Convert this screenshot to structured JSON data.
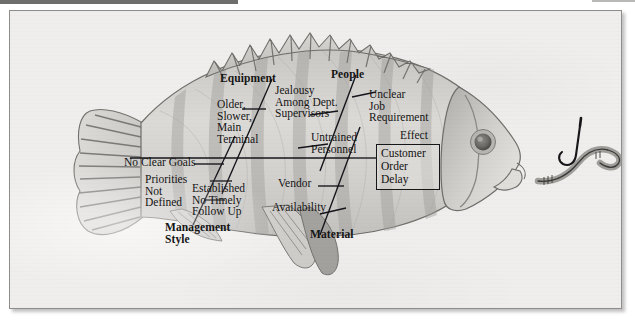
{
  "diagram": {
    "type": "fishbone-ishikawa-cause-and-effect",
    "effect": {
      "caption": "Effect",
      "box_text": "Customer\nOrder\nDelay",
      "box_lines": [
        "Customer",
        "Order",
        "Delay"
      ]
    },
    "categories": [
      {
        "id": "equipment",
        "label": "Equipment",
        "position": "upper-left",
        "causes": [
          {
            "id": "older-slower-main-terminal",
            "text": "Older,\nSlower,\nMain\nTerminal",
            "lines": [
              "Older,",
              "Slower,",
              "Main",
              "Terminal"
            ]
          }
        ]
      },
      {
        "id": "people",
        "label": "People",
        "position": "upper-right",
        "causes": [
          {
            "id": "jealousy-among-dept-supervisors",
            "text": "Jealousy\nAmong Dept.\nSupervisors",
            "lines": [
              "Jealousy",
              "Among Dept.",
              "Supervisors"
            ]
          },
          {
            "id": "unclear-job-requirement",
            "text": "Unclear\nJob\nRequirement",
            "lines": [
              "Unclear",
              "Job",
              "Requirement"
            ]
          },
          {
            "id": "untrained-personnel",
            "text": "Untrained\nPersonnel",
            "lines": [
              "Untrained",
              "Personnel"
            ]
          }
        ]
      },
      {
        "id": "management-style",
        "label": "Management\nStyle",
        "label_lines": [
          "Management",
          "Style"
        ],
        "position": "lower-left",
        "causes": [
          {
            "id": "no-clear-goals",
            "text": "No Clear Goals",
            "lines": [
              "No Clear Goals"
            ]
          },
          {
            "id": "priorities-not-defined",
            "text": "Priorities\nNot\nDefined",
            "lines": [
              "Priorities",
              "Not",
              "Defined"
            ]
          },
          {
            "id": "established-no-timely-follow-up",
            "text": "Established\nNo Timely\nFollow Up",
            "lines": [
              "Established",
              "No Timely",
              "Follow Up"
            ]
          }
        ]
      },
      {
        "id": "material",
        "label": "Material",
        "position": "lower-right",
        "causes": [
          {
            "id": "vendor",
            "text": "Vendor",
            "lines": [
              "Vendor"
            ]
          },
          {
            "id": "availability",
            "text": "Availability",
            "lines": [
              "Availability"
            ]
          }
        ]
      }
    ],
    "illustration": {
      "subject": "fish",
      "parts": [
        "tail-fin",
        "dorsal-fin",
        "pectoral-fin",
        "pelvic-fin",
        "anal-fin",
        "head",
        "eye",
        "mouth",
        "gill-cover"
      ],
      "bait": "worm-on-hook"
    },
    "colors": {
      "background": "#efeeec",
      "fish_body": "#d6d4d1",
      "fish_outline": "#6f6e6c",
      "fin_shadow": "#a8a6a3",
      "bone_line": "#14141a",
      "frame": "#8d8d8b",
      "text": "#141414"
    }
  }
}
